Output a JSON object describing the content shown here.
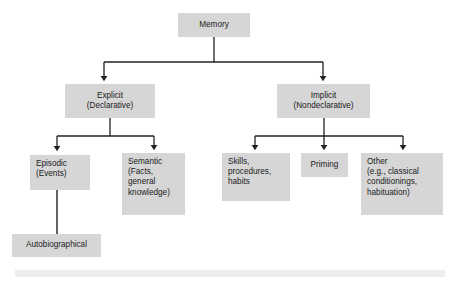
{
  "diagram": {
    "type": "hierarchy-tree",
    "title": "Memory",
    "style": {
      "node_fill": "#d6d6d6",
      "node_text": "#1a1a1a",
      "connector": "#222222",
      "background": "#ffffff",
      "footer_bar": "#ededed"
    },
    "nodes": {
      "memory": {
        "label": "Memory"
      },
      "explicit": {
        "label": "Explicit\n(Declarative)"
      },
      "implicit": {
        "label": "Implicit\n(Nondeclarative)"
      },
      "episodic": {
        "label": "Episodic\n(Events)"
      },
      "semantic": {
        "label": "Semantic\n(Facts,\ngeneral\nknowledge)"
      },
      "skills": {
        "label": "Skills,\nprocedures,\nhabits"
      },
      "priming": {
        "label": "Priming"
      },
      "other": {
        "label": "Other\n(e.g., classical\nconditionings,\nhabituation)"
      },
      "autobiographical": {
        "label": "Autobiographical"
      }
    },
    "edges": [
      {
        "from": "memory",
        "to": "explicit",
        "arrow": true
      },
      {
        "from": "memory",
        "to": "implicit",
        "arrow": true
      },
      {
        "from": "explicit",
        "to": "episodic",
        "arrow": true
      },
      {
        "from": "explicit",
        "to": "semantic",
        "arrow": true
      },
      {
        "from": "implicit",
        "to": "skills",
        "arrow": true
      },
      {
        "from": "implicit",
        "to": "priming",
        "arrow": true
      },
      {
        "from": "implicit",
        "to": "other",
        "arrow": true
      },
      {
        "from": "episodic",
        "to": "autobiographical",
        "arrow": false
      }
    ]
  }
}
